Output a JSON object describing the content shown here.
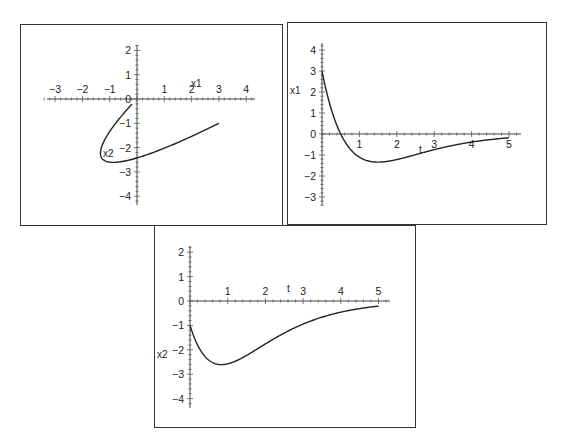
{
  "chart_data": [
    {
      "id": "phase",
      "type": "line",
      "title": "",
      "xlabel": "x1",
      "ylabel": "x2",
      "xlim": [
        -3.4,
        4.3
      ],
      "ylim": [
        -4.3,
        2.3
      ],
      "xticks": [
        -3,
        -2,
        -1,
        1,
        2,
        3,
        4
      ],
      "yticks": [
        2,
        1,
        0,
        -1,
        -2,
        -3,
        -4
      ],
      "grid": false,
      "legend": null,
      "parametric": {
        "x1": "(3-6t)e^-t",
        "x2": "(-1-6t)e^-t",
        "t_range": [
          0,
          5
        ]
      },
      "series": [
        {
          "name": "trajectory",
          "points": [
            [
              3.0,
              -1.0
            ],
            [
              2.0,
              -2.12
            ],
            [
              1.31,
              -2.63
            ],
            [
              0.0,
              -2.43
            ],
            [
              -0.55,
              -2.26
            ],
            [
              -0.94,
              -2.14
            ],
            [
              -1.1,
              -2.58
            ],
            [
              -1.14,
              -2.5
            ],
            [
              -1.34,
              -2.23
            ],
            [
              -1.08,
              -1.75
            ],
            [
              -0.9,
              -1.27
            ],
            [
              -0.62,
              -0.86
            ],
            [
              -0.37,
              -0.52
            ],
            [
              -0.18,
              -0.21
            ]
          ]
        }
      ]
    },
    {
      "id": "x1-vs-t",
      "type": "line",
      "title": "",
      "xlabel": "t",
      "ylabel": "x1",
      "xlim": [
        0,
        5.3
      ],
      "ylim": [
        -3.4,
        4.3
      ],
      "xticks": [
        1,
        2,
        3,
        4,
        5
      ],
      "yticks": [
        4,
        3,
        2,
        1,
        0,
        -1,
        -2,
        -3
      ],
      "grid": false,
      "legend": null,
      "formula": "(3-6t)e^-t",
      "series": [
        {
          "name": "x1",
          "x": [
            0,
            0.25,
            0.5,
            0.75,
            1,
            1.5,
            2,
            2.5,
            3,
            3.5,
            4,
            4.5,
            5
          ],
          "values": [
            3.0,
            1.17,
            0.0,
            -0.71,
            -1.1,
            -1.34,
            -1.22,
            -0.99,
            -0.75,
            -0.54,
            -0.38,
            -0.27,
            -0.18
          ]
        }
      ]
    },
    {
      "id": "x2-vs-t",
      "type": "line",
      "title": "",
      "xlabel": "t",
      "ylabel": "x2",
      "xlim": [
        0,
        5.3
      ],
      "ylim": [
        -4.3,
        2.3
      ],
      "xticks": [
        1,
        2,
        3,
        4,
        5
      ],
      "yticks": [
        2,
        1,
        0,
        -1,
        -2,
        -3,
        -4
      ],
      "grid": false,
      "legend": null,
      "formula": "(-1-6t)e^-t",
      "series": [
        {
          "name": "x2",
          "x": [
            0,
            0.25,
            0.5,
            0.83,
            1,
            1.5,
            2,
            2.5,
            3,
            3.5,
            4,
            4.5,
            5
          ],
          "values": [
            -1.0,
            -1.95,
            -2.43,
            -2.61,
            -2.58,
            -2.23,
            -1.76,
            -1.31,
            -0.95,
            -0.66,
            -0.46,
            -0.31,
            -0.21
          ]
        }
      ]
    }
  ],
  "panels": {
    "phase": {
      "xlabel": "x1",
      "ylabel": "x2",
      "origin_label": "0"
    },
    "x1t": {
      "xlabel": "t",
      "ylabel": "x1",
      "origin_label": "0"
    },
    "x2t": {
      "xlabel": "t",
      "ylabel": "x2",
      "origin_label": "0"
    }
  },
  "colors": {
    "curve": "#222222",
    "axis": "#444444",
    "frame": "#333333",
    "background": "#ffffff"
  }
}
